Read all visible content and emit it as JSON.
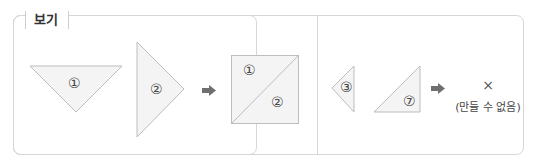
{
  "title": "보기",
  "colors": {
    "border": "#d6d6d6",
    "shape_fill": "#f4f4f4",
    "shape_stroke": "#bdbdbd",
    "arrow": "#6f6f6f",
    "text": "#333333"
  },
  "example_ok": {
    "pieces": [
      {
        "shape": "triangle-down",
        "label": "①"
      },
      {
        "shape": "triangle-right",
        "label": "②"
      }
    ],
    "arrow": "arrow-right-icon",
    "result": {
      "shape": "square-split-diagonal",
      "labels": [
        "①",
        "②"
      ]
    }
  },
  "example_fail": {
    "pieces": [
      {
        "shape": "triangle-left-small",
        "label": "③"
      },
      {
        "shape": "right-triangle",
        "label": "⑦"
      }
    ],
    "arrow": "arrow-right-icon",
    "result_mark": "×",
    "result_text": "(만들 수 없음)"
  }
}
